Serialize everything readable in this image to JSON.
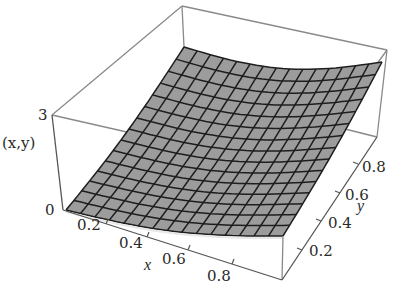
{
  "chart_data": {
    "type": "surface3d",
    "title": "",
    "zlabel": "(x,y)",
    "xlabel": "x",
    "ylabel": "y",
    "x_ticks": [
      "0.2",
      "0.4",
      "0.6",
      "0.8"
    ],
    "y_ticks": [
      "0.2",
      "0.4",
      "0.6",
      "0.8"
    ],
    "z_ticks": [
      "0",
      "3"
    ],
    "xlim": [
      0,
      1
    ],
    "ylim": [
      0,
      1
    ],
    "zlim": [
      0,
      3
    ],
    "grid_cells": 15,
    "surface_color": "#9c9c9c",
    "mesh_color": "#1e1e1e"
  },
  "labels": {
    "z_axis": "(x,y)",
    "z_min": "0",
    "z_max": "3",
    "x_axis": "x",
    "y_axis": "y",
    "x_ticks": [
      "0.2",
      "0.4",
      "0.6",
      "0.8"
    ],
    "y_ticks": [
      "0.2",
      "0.4",
      "0.6",
      "0.8"
    ]
  }
}
